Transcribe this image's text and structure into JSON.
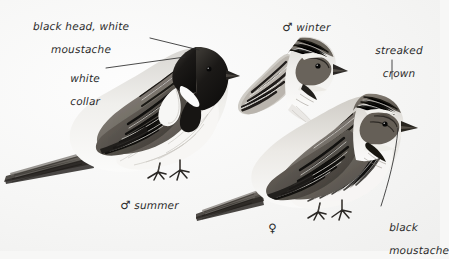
{
  "plate": {
    "subject": "Reed Bunting",
    "background_color": "#f7f7f6",
    "ink_color": "#2b2b2b",
    "style": "grayscale field-guide illustration plate with handwritten annotations"
  },
  "annotations": [
    {
      "id": "black-head-white-moustache",
      "line1": "black head, white",
      "line2": "moustache",
      "x": 74,
      "y": 10,
      "align": "center",
      "leader": {
        "type": "line",
        "x1": 150,
        "y1": 38,
        "x2": 199,
        "y2": 50
      }
    },
    {
      "id": "white-collar",
      "line1": "white",
      "line2": "collar",
      "x": 56,
      "y": 62,
      "align": "left",
      "leader": {
        "type": "line",
        "x1": 106,
        "y1": 68,
        "x2": 185,
        "y2": 57
      }
    },
    {
      "id": "streaked-crown",
      "line1": "streaked",
      "line2": "crown",
      "x": 368,
      "y": 34,
      "align": "center",
      "leader": {
        "type": "line",
        "x1": 392,
        "y1": 60,
        "x2": 392,
        "y2": 79
      }
    },
    {
      "id": "black-moustache",
      "line1": "black",
      "line2": "moustache",
      "x": 378,
      "y": 213,
      "align": "left",
      "leader": {
        "type": "line",
        "x1": 398,
        "y1": 128,
        "x2": 381,
        "y2": 206
      }
    }
  ],
  "figure_captions": [
    {
      "id": "male-summer",
      "symbol": "♂",
      "text": " summer",
      "x": 106,
      "y": 188
    },
    {
      "id": "male-winter",
      "symbol": "♂",
      "text": " winter",
      "x": 268,
      "y": 10
    },
    {
      "id": "female",
      "symbol": "♀",
      "text": "",
      "x": 254,
      "y": 211
    }
  ],
  "figures": [
    {
      "id": "male-summer-bird",
      "name": "Reed Bunting male in summer plumage",
      "pose": "full body, facing right, long tail to lower left",
      "features": [
        "black head",
        "white moustache",
        "white collar",
        "streaked brown mantle",
        "pale underparts",
        "long notched tail"
      ]
    },
    {
      "id": "male-winter-head",
      "name": "Reed Bunting male in winter plumage",
      "pose": "head and shoulders vignette, facing right",
      "features": [
        "mottled brown crown",
        "buff moustache",
        "dark malar stripe",
        "streaked nape"
      ]
    },
    {
      "id": "female-bird",
      "name": "Reed Bunting female",
      "pose": "full body, facing right, long tail to lower left",
      "features": [
        "streaked crown",
        "pale supercilium",
        "dark cheek patch",
        "black moustache",
        "streaked flanks"
      ]
    }
  ]
}
